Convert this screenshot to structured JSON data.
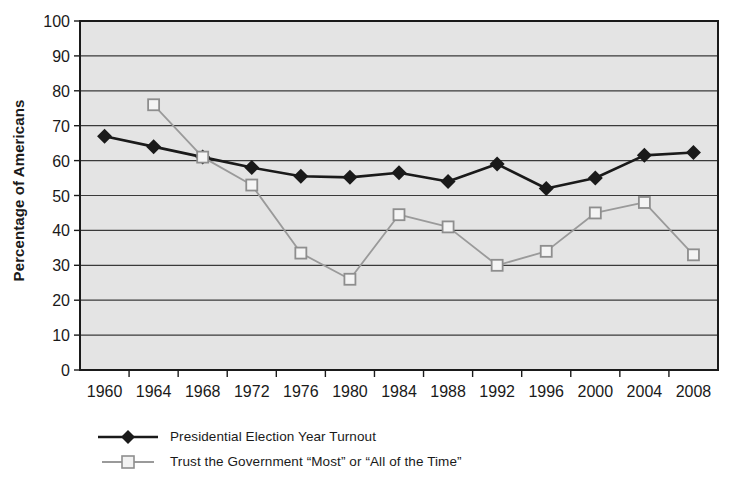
{
  "chart_data": {
    "type": "line",
    "title": "",
    "subtitle": "",
    "xlabel": "",
    "ylabel": "Percentage of Americans",
    "x": [
      1960,
      1964,
      1968,
      1972,
      1976,
      1980,
      1984,
      1988,
      1992,
      1996,
      2000,
      2004,
      2008
    ],
    "categories": [
      "1960",
      "1964",
      "1968",
      "1972",
      "1976",
      "1980",
      "1984",
      "1988",
      "1992",
      "1996",
      "2000",
      "2004",
      "2008"
    ],
    "series": [
      {
        "name": "Presidential Election Year Turnout",
        "marker": "filled-diamond",
        "color": "#1a1a1a",
        "values": [
          67.0,
          64.0,
          61.0,
          58.0,
          55.5,
          55.2,
          56.5,
          54.0,
          59.0,
          52.0,
          55.0,
          61.5,
          62.3
        ]
      },
      {
        "name": "Trust the Government “Most” or “All of the Time”",
        "marker": "open-square",
        "color": "#9a9a9a",
        "values": [
          null,
          76.0,
          61.0,
          53.0,
          33.5,
          26.0,
          44.5,
          41.0,
          30.0,
          34.0,
          45.0,
          48.0,
          33.0
        ]
      }
    ],
    "ylim": [
      0,
      100
    ],
    "yticks": [
      0,
      10,
      20,
      30,
      40,
      50,
      60,
      70,
      80,
      90,
      100
    ],
    "ytick_labels": [
      "0",
      "10",
      "20",
      "30",
      "40",
      "50",
      "60",
      "70",
      "80",
      "90",
      "100"
    ],
    "grid": true,
    "grid_axis": "y",
    "plot_background": "#e4e4e4",
    "legend_position": "below-left"
  },
  "legend": {
    "items": [
      {
        "label": "Presidential Election Year Turnout",
        "marker": "filled-diamond",
        "color": "#1a1a1a"
      },
      {
        "label": "Trust the Government “Most” or “All of the Time”",
        "marker": "open-square",
        "color": "#9a9a9a"
      }
    ]
  }
}
